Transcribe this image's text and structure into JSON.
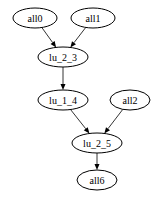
{
  "diagram": {
    "type": "directed-graph",
    "nodes": [
      {
        "id": "all0",
        "label": "all0",
        "cx": 35,
        "cy": 18,
        "rx": 22,
        "ry": 10
      },
      {
        "id": "all1",
        "label": "all1",
        "cx": 93,
        "cy": 18,
        "rx": 22,
        "ry": 10
      },
      {
        "id": "lu_2_3",
        "label": "lu_2_3",
        "cx": 63,
        "cy": 57,
        "rx": 25,
        "ry": 10
      },
      {
        "id": "lu_1_4",
        "label": "lu_1_4",
        "cx": 63,
        "cy": 100,
        "rx": 25,
        "ry": 10
      },
      {
        "id": "all2",
        "label": "all2",
        "cx": 130,
        "cy": 100,
        "rx": 20,
        "ry": 10
      },
      {
        "id": "lu_2_5",
        "label": "lu_2_5",
        "cx": 97,
        "cy": 143,
        "rx": 25,
        "ry": 10
      },
      {
        "id": "all6",
        "label": "all6",
        "cx": 97,
        "cy": 180,
        "rx": 20,
        "ry": 10
      }
    ],
    "edges": [
      {
        "from": "all0",
        "to": "lu_2_3"
      },
      {
        "from": "all1",
        "to": "lu_2_3"
      },
      {
        "from": "lu_2_3",
        "to": "lu_1_4"
      },
      {
        "from": "lu_1_4",
        "to": "lu_2_5"
      },
      {
        "from": "all2",
        "to": "lu_2_5"
      },
      {
        "from": "lu_2_5",
        "to": "all6"
      }
    ]
  }
}
